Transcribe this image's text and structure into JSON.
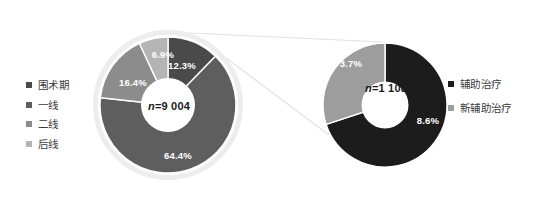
{
  "chart_data": [
    {
      "type": "pie",
      "title": "",
      "subtitle": "",
      "variant": "donut",
      "center_label": "n=9 004",
      "center_label_prefix": "n",
      "center_label_value": "=9 004",
      "total_n": 9004,
      "categories": [
        "围术期",
        "一线",
        "二线",
        "后线"
      ],
      "values": [
        12.3,
        64.4,
        16.4,
        6.9
      ],
      "value_labels": [
        "12.3%",
        "64.4%",
        "16.4%",
        "6.9%"
      ],
      "colors": [
        "#4a4a4a",
        "#5e5e5e",
        "#8c8c8c",
        "#b4b4b4"
      ],
      "legend_position": "left",
      "start_angle_deg": 0,
      "direction": "clockwise",
      "outer_ring": true,
      "outer_ring_color": "#ededed",
      "grid": false
    },
    {
      "type": "pie",
      "title": "",
      "subtitle": "",
      "variant": "donut",
      "center_label": "n=1 108",
      "center_label_prefix": "n",
      "center_label_value": "=1 108",
      "total_n": 1108,
      "categories": [
        "辅助治疗",
        "新辅助治疗"
      ],
      "values": [
        8.6,
        3.7
      ],
      "value_labels": [
        "8.6%",
        "3.7%"
      ],
      "colors": [
        "#1c1c1c",
        "#9d9d9d"
      ],
      "legend_position": "right",
      "start_angle_deg": 0,
      "direction": "clockwise",
      "outer_ring": false,
      "grid": false
    }
  ],
  "left_chart": {
    "center_label": "n=9 004",
    "center_prefix": "n",
    "center_rest": "=9 004",
    "slices": [
      {
        "label": "围术期",
        "pct_label": "12.3%",
        "value": 12.3,
        "color": "#4a4a4a"
      },
      {
        "label": "一线",
        "pct_label": "64.4%",
        "value": 64.4,
        "color": "#5e5e5e"
      },
      {
        "label": "二线",
        "pct_label": "16.4%",
        "value": 16.4,
        "color": "#8c8c8c"
      },
      {
        "label": "后线",
        "pct_label": "6.9%",
        "value": 6.9,
        "color": "#b4b4b4"
      }
    ]
  },
  "right_chart": {
    "center_label": "n=1 108",
    "center_prefix": "n",
    "center_rest": "=1 108",
    "slices": [
      {
        "label": "辅助治疗",
        "pct_label": "8.6%",
        "value": 8.6,
        "color": "#1c1c1c"
      },
      {
        "label": "新辅助治疗",
        "pct_label": "3.7%",
        "value": 3.7,
        "color": "#9d9d9d"
      }
    ]
  },
  "legend_left": {
    "items": [
      {
        "label": "围术期",
        "color": "#4a4a4a"
      },
      {
        "label": "一线",
        "color": "#5e5e5e"
      },
      {
        "label": "二线",
        "color": "#8c8c8c"
      },
      {
        "label": "后线",
        "color": "#b4b4b4"
      }
    ]
  },
  "legend_right": {
    "items": [
      {
        "label": "辅助治疗",
        "color": "#1c1c1c"
      },
      {
        "label": "新辅助治疗",
        "color": "#9d9d9d"
      }
    ]
  },
  "connector": {
    "color": "#e2e2e2",
    "description": "callout lines linking left donut perioperative wedge to right donut"
  }
}
